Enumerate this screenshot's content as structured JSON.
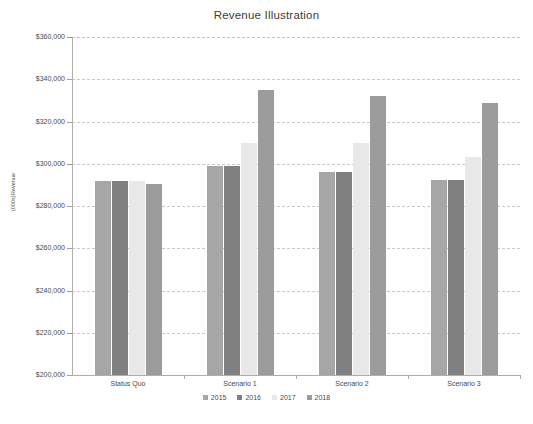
{
  "chart_data": {
    "type": "bar",
    "title": "Revenue Illustration",
    "xlabel": "",
    "ylabel": "Revenue (000s)",
    "ylabel_line1": "Revenue",
    "ylabel_line2": "(000s)",
    "categories": [
      "Status Quo",
      "Scenario 1",
      "Scenario 2",
      "Scenario 3"
    ],
    "series": [
      {
        "name": "2015",
        "color": "#a6a6a6",
        "values": [
          292000,
          299000,
          296000,
          292500
        ]
      },
      {
        "name": "2016",
        "color": "#808080",
        "values": [
          292000,
          299000,
          296000,
          292500
        ]
      },
      {
        "name": "2017",
        "color": "#e8e8e8",
        "values": [
          292000,
          310000,
          310000,
          303000
        ]
      },
      {
        "name": "2018",
        "color": "#9c9c9c",
        "values": [
          290500,
          335000,
          332000,
          329000
        ]
      }
    ],
    "ylim": [
      200000,
      360000
    ],
    "ytick_step": 20000,
    "ytick_labels": [
      "$360,000",
      "$340,000",
      "$320,000",
      "$300,000",
      "$280,000",
      "$260,000",
      "$240,000",
      "$220,000",
      "$200,000"
    ],
    "ytick_values": [
      360000,
      340000,
      320000,
      300000,
      280000,
      260000,
      240000,
      220000,
      200000
    ],
    "grid": true,
    "legend_position": "bottom",
    "background_color": "#ffffff",
    "axis_color": "#aeaeae",
    "grid_color": "#c9c9c9",
    "text_color": "#4a4a4a"
  }
}
